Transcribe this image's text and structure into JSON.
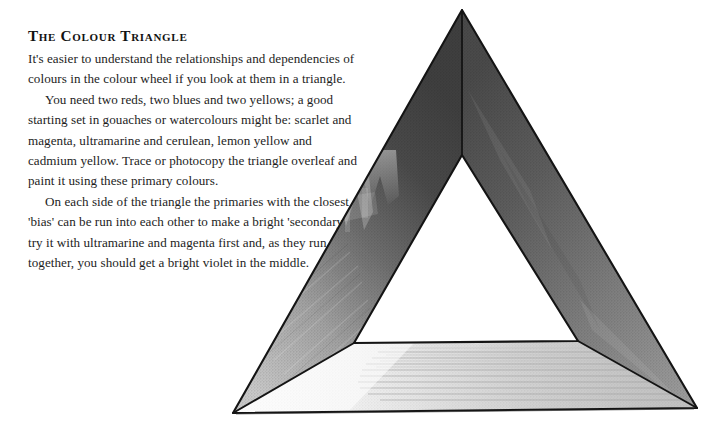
{
  "page": {
    "background_color": "#ffffff",
    "width": 724,
    "height": 430
  },
  "article": {
    "title": "The Colour Triangle",
    "paragraphs": [
      "It's easier to understand the relationships and dependencies of colours in the colour wheel if you look at them in a triangle.",
      "You need two reds, two blues and two yellows; a good starting set in gouaches or watercolours might be: scarlet and magenta, ultramarine and cerulean, lemon yellow and cadmium yellow. Trace or photocopy the triangle overleaf and paint it using these primary colours.",
      "On each side of the triangle the primaries with the closest 'bias' can be run into each other to make a bright 'secondary' – try it with ultramarine and magenta first and, as they run together, you should get a bright violet in the middle."
    ]
  },
  "illustration": {
    "name": "colour-triangle-figure",
    "description": "Folded paper triangle, three painted panels around an open centre",
    "outer_vertices": {
      "apex": [
        262,
        10
      ],
      "bottom_left": [
        33,
        413
      ],
      "bottom_right": [
        497,
        408
      ]
    },
    "inner_vertices": {
      "apex": [
        262,
        155
      ],
      "bottom_left": [
        154,
        343
      ],
      "bottom_right": [
        378,
        341
      ]
    },
    "panels": [
      {
        "name": "left-panel",
        "tone_top": "#4d4d4d",
        "tone_bottom": "#bcbcbc"
      },
      {
        "name": "right-panel",
        "tone_top": "#565656",
        "tone_bottom": "#9a9a9a"
      },
      {
        "name": "bottom-panel",
        "tone_left": "#f2f2f2",
        "tone_right": "#c9c9c9"
      }
    ],
    "edge_color": "#141414"
  }
}
